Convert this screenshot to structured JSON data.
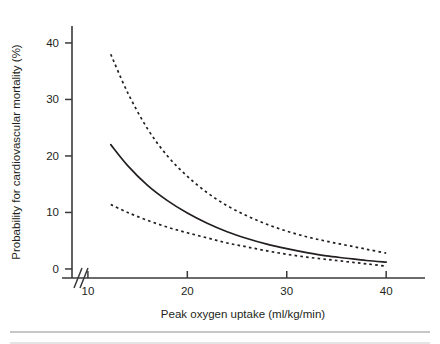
{
  "figure": {
    "background_color": "#ffffff",
    "ink_color": "#231f20",
    "axis_color": "#3a3a3c"
  },
  "chart_data": {
    "type": "line",
    "title": "",
    "subtitle": "",
    "xlabel": "Peak oxygen uptake (ml/kg/min)",
    "ylabel": "Probability for cardiovascular mortality (%)",
    "xlim": [
      8.4,
      42.8
    ],
    "ylim": [
      -1.6,
      43.0
    ],
    "xticks": [
      10,
      20,
      30,
      40
    ],
    "xtick_labels": [
      "10",
      "20",
      "30",
      "40"
    ],
    "yticks": [
      0,
      10,
      20,
      30,
      40
    ],
    "ytick_labels": [
      "0",
      "10",
      "20",
      "30",
      "40"
    ],
    "grid": false,
    "legend": "none",
    "axis_break": {
      "axis": "x",
      "present": true,
      "label": "axis-break-slashes",
      "position_x": 9.1
    },
    "x": [
      12.3,
      14,
      16,
      18,
      20,
      22,
      24,
      26,
      28,
      30,
      32,
      34,
      36,
      38,
      40
    ],
    "series": [
      {
        "name": "Upper 95% confidence limit",
        "style": "dashed",
        "values": [
          38.0,
          31.2,
          24.8,
          20.0,
          16.4,
          13.5,
          11.2,
          9.4,
          7.9,
          6.7,
          5.7,
          4.9,
          4.2,
          3.5,
          2.8
        ]
      },
      {
        "name": "Estimated probability",
        "style": "solid",
        "values": [
          22.0,
          18.3,
          14.8,
          12.1,
          9.9,
          8.1,
          6.6,
          5.4,
          4.4,
          3.6,
          2.9,
          2.3,
          1.9,
          1.5,
          1.2
        ]
      },
      {
        "name": "Lower 95% confidence limit",
        "style": "dashed",
        "values": [
          11.4,
          10.0,
          8.6,
          7.4,
          6.4,
          5.5,
          4.6,
          3.9,
          3.2,
          2.6,
          2.1,
          1.7,
          1.3,
          0.9,
          0.5
        ]
      }
    ]
  }
}
